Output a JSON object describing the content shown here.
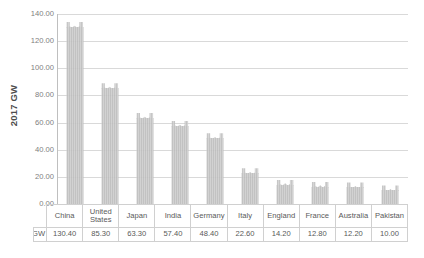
{
  "chart_data": {
    "type": "bar",
    "title": "",
    "subtitle": "",
    "xlabel": "",
    "ylabel": "2017 GW",
    "ylim": [
      0,
      140
    ],
    "ytick_step": 20,
    "grid": true,
    "legend_position": "table-row",
    "categories": [
      "China",
      "United States",
      "Japan",
      "India",
      "Germany",
      "Italy",
      "England",
      "France",
      "Australia",
      "Pakistan"
    ],
    "values": [
      130.4,
      85.3,
      63.3,
      57.4,
      48.4,
      22.6,
      14.2,
      12.8,
      12.2,
      10.0
    ],
    "value_labels": [
      "130.40",
      "85.30",
      "63.30",
      "57.40",
      "48.40",
      "22.60",
      "14.20",
      "12.80",
      "12.20",
      "10.00"
    ],
    "ytick_labels": [
      "140.00",
      "120.00",
      "100.00",
      "80.00",
      "60.00",
      "40.00",
      "20.00",
      "0.00"
    ],
    "ytick_values": [
      140,
      120,
      100,
      80,
      60,
      40,
      20,
      0
    ],
    "series": [
      {
        "name": "GW",
        "color": "#c4c4c4",
        "values": [
          130.4,
          85.3,
          63.3,
          57.4,
          48.4,
          22.6,
          14.2,
          12.8,
          12.2,
          10.0
        ]
      }
    ]
  },
  "axis": {
    "y_title": "2017 GW"
  },
  "legend": {
    "series_label": "GW",
    "swatch_color": "#c4c4c4"
  },
  "data_table": {
    "header": [
      "China",
      "United States",
      "Japan",
      "India",
      "Germany",
      "Italy",
      "England",
      "France",
      "Australia",
      "Pakistan"
    ],
    "values": [
      "130.40",
      "85.30",
      "63.30",
      "57.40",
      "48.40",
      "22.60",
      "14.20",
      "12.80",
      "12.20",
      "10.00"
    ]
  },
  "colors": {
    "bar_fill": "#c4c4c4",
    "grid_line": "#d9d9d9",
    "axis_line": "#bfbfbf",
    "text": "#595959",
    "background": "#ffffff"
  }
}
